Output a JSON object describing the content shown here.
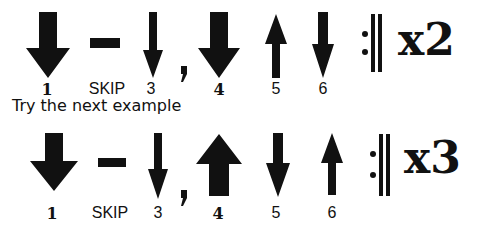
{
  "patterns": [
    {
      "beats": [
        {
          "label": "1",
          "type": "down-thick"
        },
        {
          "label": "SKIP",
          "type": "skip"
        },
        {
          "label": "3",
          "type": "down-thin"
        },
        {
          "label": ",",
          "type": "comma"
        },
        {
          "label": "4",
          "type": "down-thick"
        },
        {
          "label": "5",
          "type": "up-thin"
        },
        {
          "label": "6",
          "type": "down-thin"
        }
      ],
      "repeat_symbol": ":||",
      "multiplier": "x2"
    },
    {
      "beats": [
        {
          "label": "1",
          "type": "down-thick"
        },
        {
          "label": "SKIP",
          "type": "skip"
        },
        {
          "label": "3",
          "type": "down-thin"
        },
        {
          "label": ",",
          "type": "comma"
        },
        {
          "label": "4",
          "type": "up-thick"
        },
        {
          "label": "5",
          "type": "down-thin"
        },
        {
          "label": "6",
          "type": "up-thin"
        }
      ],
      "repeat_symbol": ":||",
      "multiplier": "x3"
    }
  ],
  "caption": "Try the next example",
  "labels": {
    "r1": {
      "b1": "1",
      "b2": "SKIP",
      "b3": "3",
      "b4": "4",
      "b5": "5",
      "b6": "6",
      "mult": "x2"
    },
    "r2": {
      "b1": "1",
      "b2": "SKIP",
      "b3": "3",
      "b4": "4",
      "b5": "5",
      "b6": "6",
      "mult": "x3"
    }
  },
  "colors": {
    "ink": "#111111",
    "background": "#ffffff"
  }
}
